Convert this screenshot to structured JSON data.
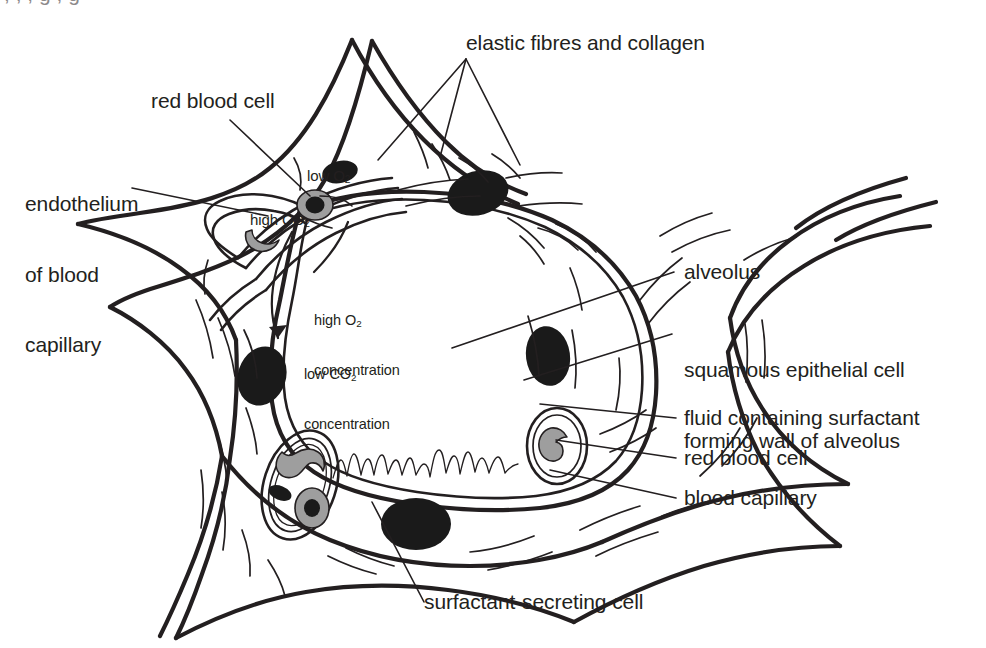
{
  "figure": {
    "background_color": "#ffffff",
    "ink_color": "#231f20",
    "rbc_fill_color": "#9e9e9e",
    "nucleus_fill_color": "#1a1a1a"
  },
  "clipped_top_line": ", , , g , g",
  "labels": {
    "elastic_fibres": "elastic fibres and collagen",
    "red_blood_cell_top": "red blood cell",
    "endothelium": "endothelium\nof blood\ncapillary",
    "endothelium_line1": "endothelium",
    "endothelium_line2": "of blood",
    "endothelium_line3": "capillary",
    "low_o2_prefix": "low O",
    "low_o2_sub": "2",
    "high_co2_prefix": "high CO",
    "high_co2_sub": "2",
    "high_o2_line1_prefix": "high O",
    "high_o2_line1_sub": "2",
    "high_o2_line2": "concentration",
    "low_co2_line1_prefix": "low CO",
    "low_co2_line1_sub": "2",
    "low_co2_line2": "concentration",
    "alveolus": "alveolus",
    "squamous_line1": "squamous epithelial cell",
    "squamous_line2": "forming wall of alveolus",
    "fluid_surfactant": "fluid containing surfactant",
    "red_blood_cell_right": "red blood cell",
    "blood_capillary": "blood capillary",
    "surfactant_cell": "surfactant-secreting cell"
  },
  "structures": {
    "alveolus_lumen": "alveolar air space",
    "alveolar_wall": "squamous epithelial cell wall",
    "surfactant_fluid_layer": "wavy fluid layer lining alveolus",
    "capillary_upper_left": "blood capillary upper left",
    "capillary_lower_left": "blood capillary lower left",
    "capillary_right": "blood capillary right",
    "nuclei_count": 6,
    "red_blood_cells_count": 5
  }
}
